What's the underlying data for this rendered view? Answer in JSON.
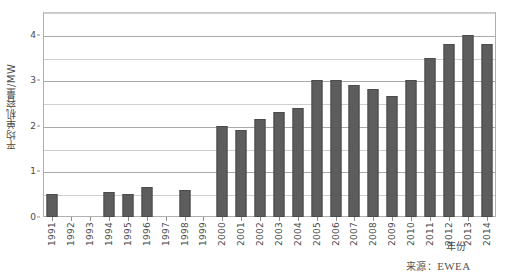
{
  "chart_data": {
    "type": "bar",
    "title": "",
    "subtitle": "",
    "xlabel": "年份",
    "ylabel": "平均单机容量/MW",
    "ylim": [
      0,
      4.5
    ],
    "y_major_ticks": [
      0,
      1,
      2,
      3,
      4
    ],
    "y_minor_gridlines": [
      0.5,
      1.5,
      2.5,
      3.5,
      4.5
    ],
    "y_tick_labels": [
      "0",
      "1",
      "2",
      "3",
      "4"
    ],
    "grid": true,
    "legend": false,
    "legend_position": "none",
    "series_color": "#5d5d5d",
    "categories": [
      "1991",
      "1992",
      "1993",
      "1994",
      "1995",
      "1996",
      "1997",
      "1998",
      "1999",
      "2000",
      "2001",
      "2002",
      "2003",
      "2004",
      "2005",
      "2006",
      "2007",
      "2008",
      "2009",
      "2010",
      "2011",
      "2012",
      "2013",
      "2014"
    ],
    "values": [
      0.5,
      0,
      0,
      0.55,
      0.5,
      0.65,
      0,
      0.6,
      0,
      2.0,
      1.9,
      2.15,
      2.3,
      2.4,
      3.0,
      3.0,
      2.9,
      2.8,
      2.65,
      3.0,
      3.5,
      3.8,
      4.0,
      3.8
    ],
    "annotations": [
      "来源：EWEA"
    ]
  },
  "axes": {
    "y_title": "平均单机容量/MW",
    "x_title": "年份"
  },
  "source": {
    "label_cn": "来源：",
    "organization": "EWEA",
    "full": "来源：EWEA"
  }
}
